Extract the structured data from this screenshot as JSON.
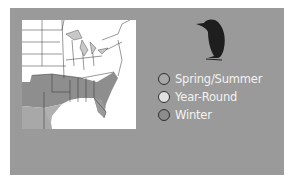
{
  "range_map": {
    "title": "Range map",
    "colors": {
      "background": "#9a9a9a",
      "map_background": "#ffffff",
      "spring_summer": "#a8a8a8",
      "year_round": "#d8d8d8",
      "winter": "#8e8e8e"
    },
    "icon": "bird-silhouette-icon",
    "legend": [
      {
        "label": "Spring/Summer",
        "color": "#a8a8a8"
      },
      {
        "label": "Year-Round",
        "color": "#e0e0e0"
      },
      {
        "label": "Winter",
        "color": "#8c8c8c"
      }
    ]
  }
}
